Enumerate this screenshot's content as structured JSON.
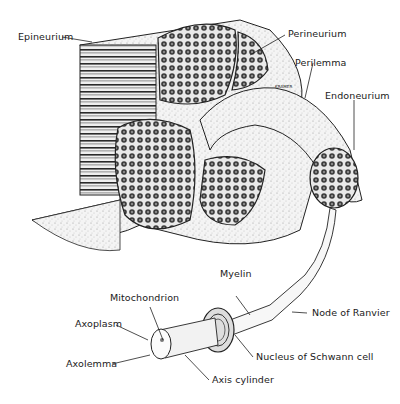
{
  "diagram": {
    "labels": {
      "epineurium": "Epineurium",
      "perineurium": "Perineurium",
      "perilemma": "Perilemma",
      "endoneurium": "Endoneurium",
      "myelin": "Myelin",
      "mitochondrion": "Mitochondrion",
      "axoplasm": "Axoplasm",
      "axolemma": "Axolemma",
      "node_of_ranvier": "Node of Ranvier",
      "nucleus_of_schwann_cell": "Nucleus of Schwann cell",
      "axis_cylinder": "Axis cylinder"
    },
    "signature": "KRAMER"
  }
}
